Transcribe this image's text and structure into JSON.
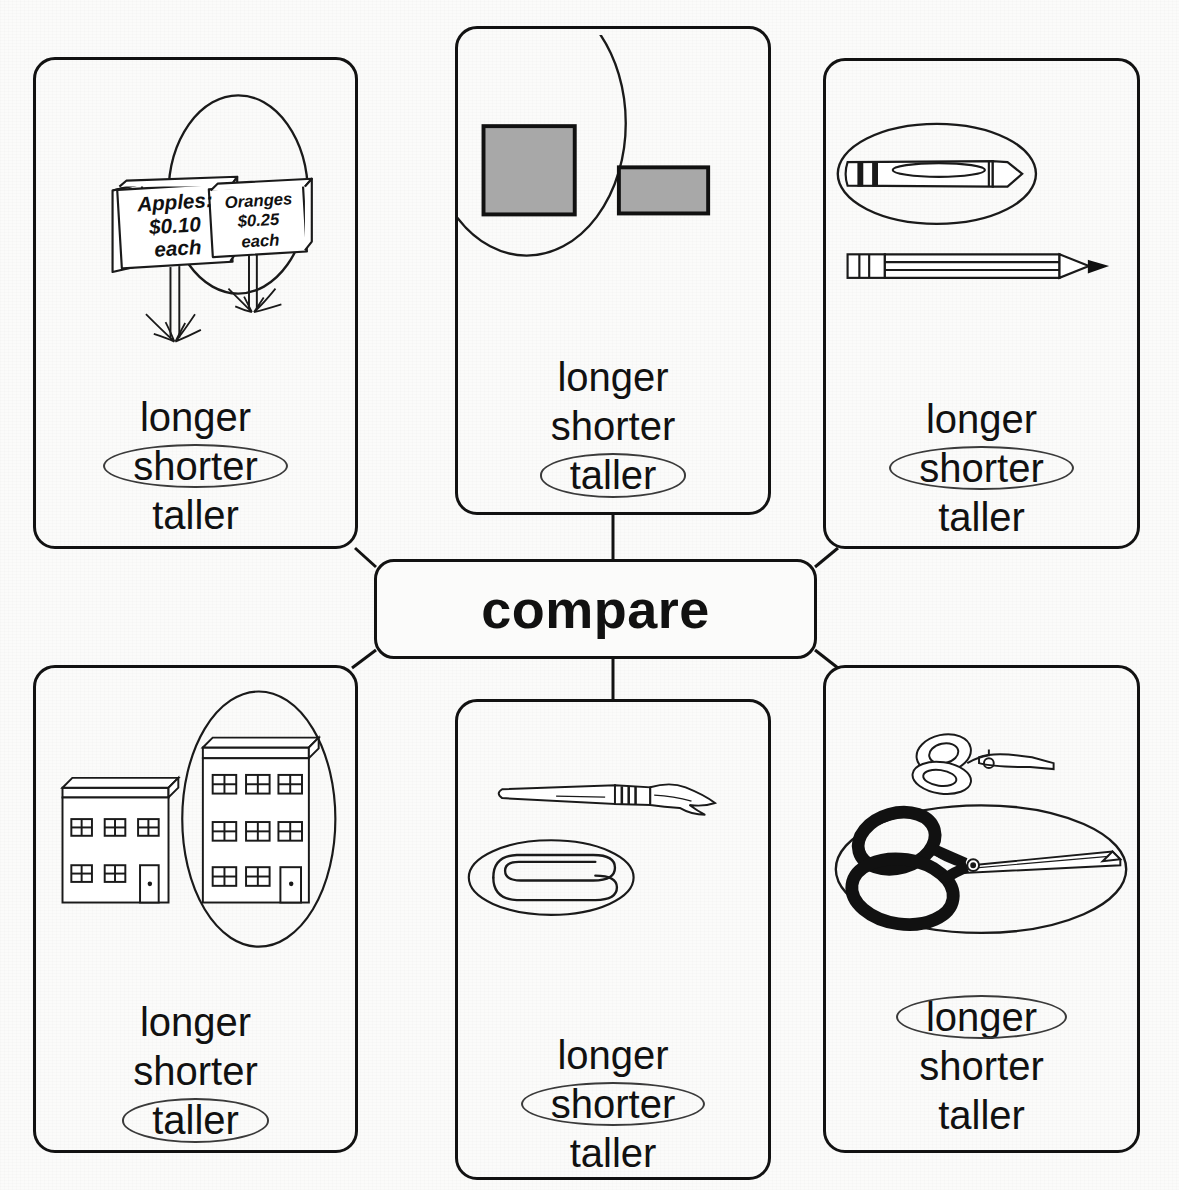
{
  "worksheet": {
    "hub_label": "compare",
    "option_set": [
      "longer",
      "shorter",
      "taller"
    ]
  },
  "cards": [
    {
      "id": "card-price-signs",
      "position": "top-left",
      "scene": "two-price-signs-in-grass",
      "signs": [
        {
          "line1": "Apples:",
          "line2": "$0.10",
          "line3": "each",
          "circled": false
        },
        {
          "line1": "Oranges",
          "line2": "$0.25",
          "line3": "each",
          "circled": true
        }
      ],
      "options": [
        "longer",
        "shorter",
        "taller"
      ],
      "selected": "shorter"
    },
    {
      "id": "card-gray-shapes",
      "position": "top-middle",
      "scene": "gray-square-and-gray-rectangle",
      "shapes": [
        {
          "name": "gray-square",
          "circled": true,
          "fill": "#a8a8a8"
        },
        {
          "name": "gray-rectangle",
          "circled": false,
          "fill": "#a8a8a8"
        }
      ],
      "options": [
        "longer",
        "shorter",
        "taller"
      ],
      "selected": "taller"
    },
    {
      "id": "card-crayon-pencil",
      "position": "top-right",
      "scene": "crayon-and-pencil",
      "shapes": [
        {
          "name": "crayon",
          "circled": true
        },
        {
          "name": "pencil",
          "circled": false
        }
      ],
      "options": [
        "longer",
        "shorter",
        "taller"
      ],
      "selected": "shorter"
    },
    {
      "id": "card-buildings",
      "position": "bottom-left",
      "scene": "two-story-and-three-story-buildings",
      "shapes": [
        {
          "name": "two-story-building",
          "circled": false
        },
        {
          "name": "three-story-building",
          "circled": true
        }
      ],
      "options": [
        "longer",
        "shorter",
        "taller"
      ],
      "selected": "taller"
    },
    {
      "id": "card-brush-paperclip",
      "position": "bottom-middle",
      "scene": "paintbrush-and-paperclip",
      "shapes": [
        {
          "name": "paintbrush",
          "circled": false
        },
        {
          "name": "paperclip",
          "circled": true
        }
      ],
      "options": [
        "longer",
        "shorter",
        "taller"
      ],
      "selected": "shorter"
    },
    {
      "id": "card-scissors",
      "position": "bottom-right",
      "scene": "small-scissors-and-large-scissors",
      "shapes": [
        {
          "name": "small-scissors",
          "circled": false
        },
        {
          "name": "large-scissors",
          "circled": true
        }
      ],
      "options": [
        "longer",
        "shorter",
        "taller"
      ],
      "selected": "longer"
    }
  ]
}
